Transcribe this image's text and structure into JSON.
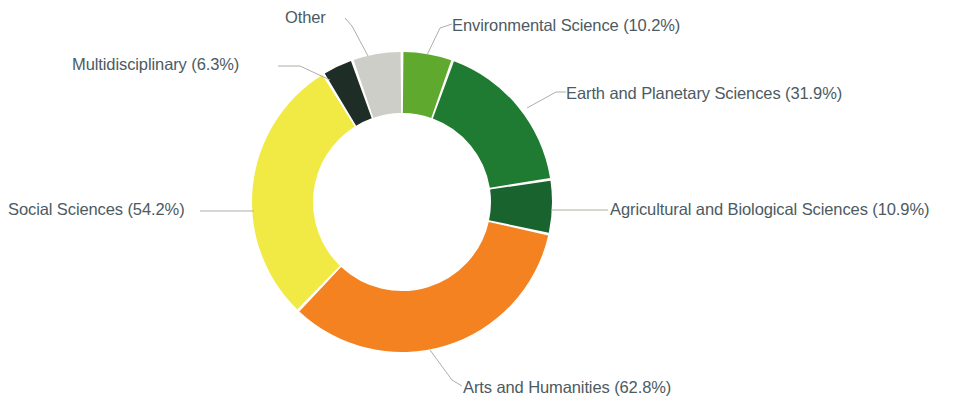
{
  "chart_data": {
    "type": "pie",
    "variant": "donut",
    "title": "",
    "subtitle": "",
    "xlabel": "",
    "ylabel": "",
    "legend_position": "none",
    "labels_outside": true,
    "label_text_color": "#4c5a62",
    "background_color": "#ffffff",
    "leader_line_color": "#b0ada4",
    "center_x": 402,
    "center_y": 202,
    "outer_radius": 150,
    "inner_radius": 89,
    "start_angle_deg": -90,
    "direction": "clockwise",
    "categories": [
      "Environmental Science",
      "Earth and Planetary Sciences",
      "Agricultural and Biological Sciences",
      "Arts and Humanities",
      "Social Sciences",
      "Multidisciplinary",
      "Other"
    ],
    "values": [
      10.2,
      31.9,
      10.9,
      62.8,
      54.2,
      6.3,
      10.0
    ],
    "value_unit": "%",
    "colors": [
      "#5faa2e",
      "#1f7a32",
      "#19642e",
      "#f58220",
      "#f2ea44",
      "#1e2d26",
      "#cdcec8"
    ],
    "slices": [
      {
        "label": "Environmental Science",
        "value": 10.2,
        "display": "Environmental Science (10.2%)",
        "color": "#5faa2e",
        "sweep_deg": 21.0
      },
      {
        "label": "Earth and Planetary Sciences",
        "value": 31.9,
        "display": "Earth and Planetary Sciences (31.9%)",
        "color": "#1f7a32",
        "sweep_deg": 65.6
      },
      {
        "label": "Agricultural and Biological Sciences",
        "value": 10.9,
        "display": "Agricultural and Biological Sciences (10.9%)",
        "color": "#19642e",
        "sweep_deg": 22.4
      },
      {
        "label": "Arts and Humanities",
        "value": 62.8,
        "display": "Arts and Humanities (62.8%)",
        "color": "#f58220",
        "sweep_deg": 129.2
      },
      {
        "label": "Social Sciences",
        "value": 54.2,
        "display": "Social Sciences (54.2%)",
        "color": "#f2ea44",
        "sweep_deg": 111.5
      },
      {
        "label": "Multidisciplinary",
        "value": 6.3,
        "display": "Multidisciplinary (6.3%)",
        "color": "#1e2d26",
        "sweep_deg": 13.0
      },
      {
        "label": "Other",
        "value": 10.0,
        "display": "Other",
        "color": "#cdcec8",
        "sweep_deg": 20.6
      }
    ]
  },
  "labels": {
    "environmental_science": "Environmental Science (10.2%)",
    "earth_and_planetary_sciences": "Earth and Planetary Sciences (31.9%)",
    "agricultural_and_biological_sciences": "Agricultural and Biological Sciences (10.9%)",
    "arts_and_humanities": "Arts and Humanities (62.8%)",
    "social_sciences": "Social Sciences (54.2%)",
    "multidisciplinary": "Multidisciplinary (6.3%)",
    "other": "Other"
  }
}
